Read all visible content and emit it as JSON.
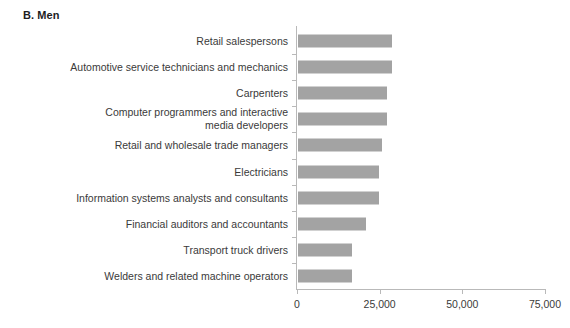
{
  "panel": {
    "title": "B. Men"
  },
  "chart_data": {
    "type": "bar",
    "orientation": "horizontal",
    "title": "B. Men",
    "xlabel": "",
    "ylabel": "",
    "xlim": [
      0,
      75000
    ],
    "xticks": [
      0,
      25000,
      50000,
      75000
    ],
    "xticklabels": [
      "0",
      "25,000",
      "50,000",
      "75,000"
    ],
    "grid": false,
    "legend": false,
    "bar_color": "#a3a3a3",
    "axis_color": "#b9b9b9",
    "text_color": "#3a3a3a",
    "categories": [
      "Retail salespersons",
      "Automotive service technicians and mechanics",
      "Carpenters",
      "Computer programmers and interactive\nmedia developers",
      "Retail and wholesale trade managers",
      "Electricians",
      "Information systems analysts and consultants",
      "Financial auditors and accountants",
      "Transport truck drivers",
      "Welders and related machine operators"
    ],
    "values": [
      28500,
      28500,
      27000,
      27000,
      25400,
      24500,
      24500,
      20500,
      16300,
      16300
    ]
  }
}
